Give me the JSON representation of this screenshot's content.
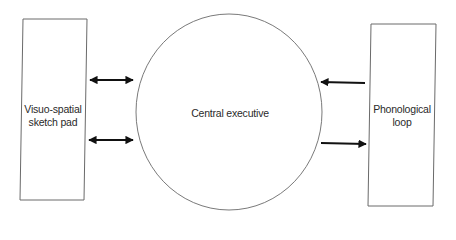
{
  "diagram": {
    "type": "working-memory-model",
    "nodes": {
      "left_box": {
        "label_lines": [
          "Visuo-spatial",
          "sketch pad"
        ]
      },
      "center_circle": {
        "label": "Central executive"
      },
      "right_box": {
        "label_lines": [
          "Phonological",
          "loop"
        ]
      }
    },
    "edges": [
      {
        "from": "left_box",
        "to": "center_circle",
        "direction": "bidirectional"
      },
      {
        "from": "left_box",
        "to": "center_circle",
        "direction": "bidirectional"
      },
      {
        "from": "right_box",
        "to": "center_circle",
        "direction": "to-center"
      },
      {
        "from": "center_circle",
        "to": "right_box",
        "direction": "to-right"
      }
    ],
    "colors": {
      "stroke": "#6a6a6a",
      "arrow": "#111111",
      "background": "#ffffff",
      "text": "#2a2a2a"
    }
  }
}
